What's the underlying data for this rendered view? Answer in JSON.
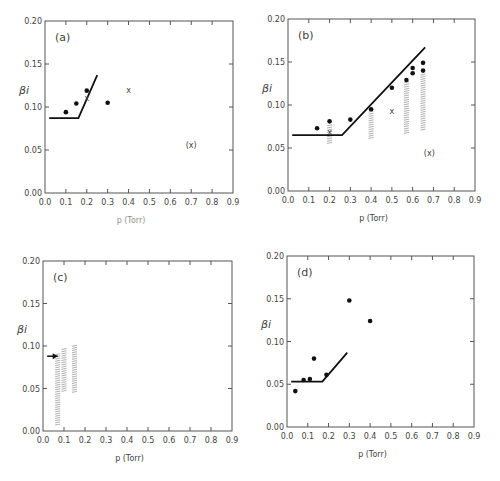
{
  "figure": {
    "colors": {
      "axis": "#555555",
      "ink": "#111111",
      "hatch": "#9a9a9a",
      "text": "#444444"
    }
  },
  "chart_data": [
    {
      "panel": "(a)",
      "type": "scatter",
      "box": {
        "left": 45,
        "top": 21,
        "right": 233,
        "bottom": 193
      },
      "xlabel": "p (Torr)",
      "ylabel": "βi",
      "xlim": [
        0.0,
        0.9
      ],
      "ylim": [
        0.0,
        0.2
      ],
      "xticks": [
        "0.0",
        "0.1",
        "0.2",
        "0.3",
        "0.4",
        "0.5",
        "0.6",
        "0.7",
        "0.8",
        "0.9"
      ],
      "yticks": [
        "0.00",
        "0.05",
        "0.10",
        "0.15",
        "0.20"
      ],
      "show_xlabel": false,
      "dots": [
        [
          0.1,
          0.094
        ],
        [
          0.15,
          0.104
        ],
        [
          0.2,
          0.119
        ],
        [
          0.3,
          0.105
        ]
      ],
      "crosses": [
        [
          0.2,
          0.11
        ],
        [
          0.4,
          0.12
        ]
      ],
      "annotations": [
        {
          "text": "(x)",
          "x": 0.7,
          "y": 0.056
        }
      ],
      "line": [
        [
          0.02,
          0.087
        ],
        [
          0.16,
          0.087
        ],
        [
          0.25,
          0.137
        ]
      ],
      "hatched_bars": [],
      "arrows": []
    },
    {
      "panel": "(b)",
      "type": "scatter",
      "box": {
        "left": 288,
        "top": 19,
        "right": 475,
        "bottom": 191
      },
      "xlabel": "p (Torr)",
      "ylabel": "βi",
      "xlim": [
        0.0,
        0.9
      ],
      "ylim": [
        0.0,
        0.2
      ],
      "xticks": [
        "0.0",
        "0.1",
        "0.2",
        "0.3",
        "0.4",
        "0.5",
        "0.6",
        "0.7",
        "0.8",
        "0.9"
      ],
      "yticks": [
        "0.00",
        "0.05",
        "0.10",
        "0.15",
        "0.20"
      ],
      "show_xlabel": true,
      "dots": [
        [
          0.14,
          0.073
        ],
        [
          0.2,
          0.081
        ],
        [
          0.3,
          0.083
        ],
        [
          0.4,
          0.095
        ],
        [
          0.5,
          0.12
        ],
        [
          0.57,
          0.129
        ],
        [
          0.6,
          0.137
        ],
        [
          0.6,
          0.143
        ],
        [
          0.65,
          0.14
        ],
        [
          0.65,
          0.149
        ]
      ],
      "crosses": [
        [
          0.2,
          0.069
        ],
        [
          0.5,
          0.093
        ]
      ],
      "annotations": [
        {
          "text": "(x)",
          "x": 0.68,
          "y": 0.044
        }
      ],
      "line": [
        [
          0.02,
          0.065
        ],
        [
          0.26,
          0.065
        ],
        [
          0.66,
          0.167
        ]
      ],
      "hatched_bars": [
        [
          0.2,
          0.054,
          0.077
        ],
        [
          0.4,
          0.061,
          0.093
        ],
        [
          0.57,
          0.068,
          0.127
        ],
        [
          0.65,
          0.071,
          0.136
        ]
      ],
      "arrows": []
    },
    {
      "panel": "(c)",
      "type": "scatter",
      "box": {
        "left": 43,
        "top": 261,
        "right": 232,
        "bottom": 431
      },
      "xlabel": "p (Torr)",
      "ylabel": "βi",
      "xlim": [
        0.0,
        0.9
      ],
      "ylim": [
        0.0,
        0.2
      ],
      "xticks": [
        "0.0",
        "0.1",
        "0.2",
        "0.3",
        "0.4",
        "0.5",
        "0.6",
        "0.7",
        "0.8",
        "0.9"
      ],
      "yticks": [
        "0.00",
        "0.05",
        "0.10",
        "0.15",
        "0.20"
      ],
      "show_xlabel": true,
      "dots": [],
      "crosses": [],
      "annotations": [],
      "line": [],
      "hatched_bars": [
        [
          0.07,
          0.006,
          0.091
        ],
        [
          0.1,
          0.047,
          0.097
        ],
        [
          0.15,
          0.046,
          0.101
        ]
      ],
      "arrows": [
        [
          0.02,
          0.088,
          0.07,
          0.088
        ]
      ]
    },
    {
      "panel": "(d)",
      "type": "scatter",
      "box": {
        "left": 287,
        "top": 256,
        "right": 474,
        "bottom": 427
      },
      "xlabel": "p (Torr)",
      "ylabel": "βi",
      "xlim": [
        0.0,
        0.9
      ],
      "ylim": [
        0.0,
        0.2
      ],
      "xticks": [
        "0.0",
        "0.1",
        "0.2",
        "0.3",
        "0.4",
        "0.5",
        "0.6",
        "0.7",
        "0.8",
        "0.9"
      ],
      "yticks": [
        "0.00",
        "0.05",
        "0.10",
        "0.15",
        "0.20"
      ],
      "show_xlabel": true,
      "dots": [
        [
          0.04,
          0.042
        ],
        [
          0.08,
          0.055
        ],
        [
          0.11,
          0.056
        ],
        [
          0.13,
          0.08
        ],
        [
          0.19,
          0.061
        ],
        [
          0.3,
          0.148
        ],
        [
          0.4,
          0.124
        ]
      ],
      "crosses": [],
      "annotations": [],
      "line": [
        [
          0.02,
          0.053
        ],
        [
          0.17,
          0.053
        ],
        [
          0.29,
          0.087
        ]
      ],
      "hatched_bars": [],
      "arrows": []
    }
  ]
}
